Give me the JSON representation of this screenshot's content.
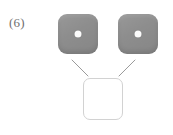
{
  "problem": {
    "label": "(6)",
    "type": "dice-addition-puzzle"
  },
  "colors": {
    "die_face": "#8d8d8d",
    "pip": "#fbfbfb",
    "connector_line": "#9a9a9a",
    "answer_box_border": "#d2d2d2",
    "label_text": "#6f6f6f",
    "background": "#ffffff"
  },
  "dice": [
    {
      "name": "left-die",
      "pips": 1,
      "value": "1",
      "face": "one"
    },
    {
      "name": "right-die",
      "pips": 1,
      "value": "1",
      "face": "one"
    }
  ],
  "connectors": [
    {
      "name": "left-connector",
      "x1": 72,
      "y1": 60,
      "x2": 88,
      "y2": 76
    },
    {
      "name": "right-connector",
      "x1": 135,
      "y1": 60,
      "x2": 119,
      "y2": 76
    }
  ],
  "answer_box": {
    "name": "answer-box",
    "value": "",
    "placeholder": ""
  }
}
